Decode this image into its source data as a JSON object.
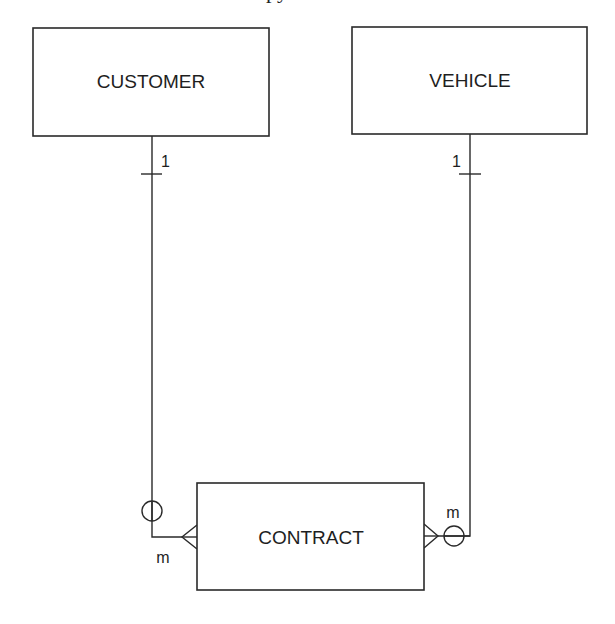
{
  "diagram": {
    "type": "entity-relationship",
    "clipped_title_fragment": "py",
    "entities": [
      {
        "id": "customer",
        "label": "CUSTOMER",
        "x": 33,
        "y": 28,
        "w": 236,
        "h": 108
      },
      {
        "id": "vehicle",
        "label": "VEHICLE",
        "x": 352,
        "y": 27,
        "w": 235,
        "h": 107
      },
      {
        "id": "contract",
        "label": "CONTRACT",
        "x": 197,
        "y": 483,
        "w": 227,
        "h": 107
      }
    ],
    "relationships": [
      {
        "from": "customer",
        "to": "contract",
        "from_cardinality": "1",
        "to_cardinality": "m",
        "optional_on": "contract-side",
        "notation": "one-to-many, optional (circle) at many end"
      },
      {
        "from": "vehicle",
        "to": "contract",
        "from_cardinality": "1",
        "to_cardinality": "m",
        "optional_on": "contract-side",
        "notation": "one-to-many, optional (circle) at many end"
      }
    ],
    "labels": {
      "customer_one": "1",
      "vehicle_one": "1",
      "contract_many_left": "m",
      "contract_many_right": "m"
    },
    "colors": {
      "line": "#2a2a2a",
      "background": "#ffffff",
      "text": "#1e1e1e"
    }
  }
}
